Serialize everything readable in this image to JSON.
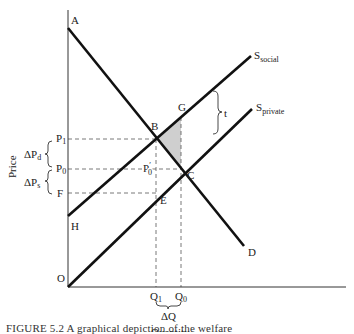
{
  "diagram": {
    "type": "supply-demand-externality",
    "axes": {
      "y_label": "Price",
      "x_label": "Quantity",
      "origin": "O"
    },
    "points": {
      "A": "A",
      "B": "B",
      "C": "C",
      "D": "D",
      "E": "E",
      "F": "F",
      "G": "G",
      "H": "H"
    },
    "curves": {
      "demand": "D",
      "s_social": {
        "base": "S",
        "sub": "social"
      },
      "s_private": {
        "base": "S",
        "sub": "private"
      }
    },
    "price_labels": {
      "p1": {
        "base": "P",
        "sub": "1"
      },
      "p0": {
        "base": "P",
        "sub": "0"
      },
      "p0_prime": {
        "base": "P",
        "sub": "0",
        "prime": "′"
      },
      "f": "F"
    },
    "quantity_labels": {
      "q1": {
        "base": "Q",
        "sub": "1"
      },
      "q0": {
        "base": "Q",
        "sub": "0"
      },
      "delta_q": "ΔQ"
    },
    "brackets": {
      "delta_pd": {
        "base": "ΔP",
        "sub": "d"
      },
      "delta_ps": {
        "base": "ΔP",
        "sub": "s"
      },
      "tax": "t"
    },
    "shaded_region": {
      "vertices": [
        "B",
        "G",
        "C"
      ],
      "color": "#cfcfcf"
    }
  },
  "caption": "FIGURE 5.2 A graphical depiction of the welfare"
}
